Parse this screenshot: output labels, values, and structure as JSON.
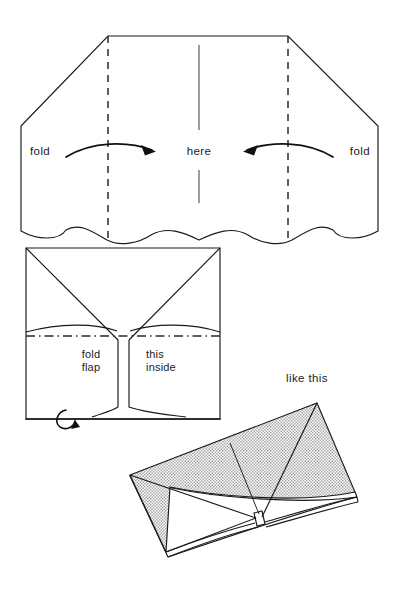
{
  "figure": {
    "background_color": "#ffffff",
    "ink_color": "#1a1a1a",
    "shade_color": "#b8b8b8",
    "width": 402,
    "height": 604
  },
  "step_one": {
    "name": "unfolded sheet with fold creases",
    "label_fold_left": "fold",
    "label_here": "here",
    "label_fold_right": "fold",
    "crease_left_x": 108,
    "crease_right_x": 288,
    "center_x": 199
  },
  "step_two": {
    "name": "folded sheet showing flap",
    "label_fold": "fold",
    "label_flap": "flap",
    "label_this": "this",
    "label_inside": "inside"
  },
  "step_three": {
    "name": "finished folded envelope",
    "label_like_this": "like this"
  }
}
